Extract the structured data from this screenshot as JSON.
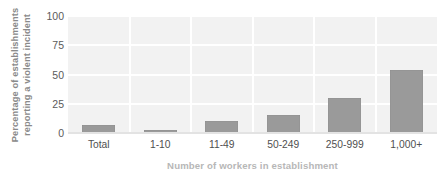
{
  "chart_data": {
    "type": "bar",
    "title": "",
    "subtitle": "",
    "xlabel": "Number of workers in establishment",
    "ylabel": "Percentage of establishments reporting a violent incident",
    "ylabel_lines": [
      "Percentage of establishments",
      "reporting a violent incident"
    ],
    "categories": [
      "Total",
      "1-10",
      "11-49",
      "50-249",
      "250-999",
      "1,000+"
    ],
    "values": [
      7,
      3,
      10,
      15,
      30,
      54
    ],
    "ylim": [
      0,
      100
    ],
    "yticks": [
      100,
      75,
      50,
      25,
      0
    ],
    "ytick_labels": [
      "100",
      "75",
      "50",
      "25",
      "0"
    ],
    "grid": true,
    "grid_orientation": "both",
    "legend": false,
    "legend_position": "none",
    "bar_color": "#9a9a9a",
    "plot_background": "#f2f2f2",
    "gridline_color": "#ffffff",
    "axis_title_color": "#b7b7b7",
    "tick_label_color": "#4f4f4f"
  }
}
